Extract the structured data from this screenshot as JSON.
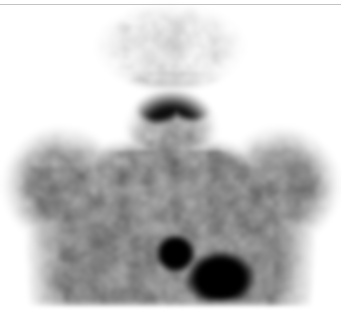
{
  "viewer": {
    "modality_label": "Nuclear medicine scintigraphy",
    "view_label": "Anterior whole-body (head / neck / thorax)",
    "width": 341,
    "height": 331,
    "background_color": "#ffffff",
    "border_rule_color": "#b8b8b8"
  },
  "colormap": {
    "name": "inverted-grayscale",
    "min_label": "low counts",
    "max_label": "high counts",
    "min_color": "#ffffff",
    "mid_color": "#9a9a9a",
    "max_color": "#000000"
  },
  "chart_data": {
    "type": "heatmap",
    "xlabel": "",
    "ylabel": "",
    "grid": false,
    "legend": "none",
    "xlim": [
      0,
      341
    ],
    "ylim": [
      0,
      331
    ],
    "intensity_scale": {
      "encoding": "inverted grayscale, darker = higher radiotracer uptake",
      "levels": [
        {
          "label": "background (no counts)",
          "gray": 255,
          "hex": "#ffffff"
        },
        {
          "label": "faint soft tissue",
          "gray": 225,
          "hex": "#e1e1e1"
        },
        {
          "label": "low soft tissue",
          "gray": 200,
          "hex": "#c8c8c8"
        },
        {
          "label": "moderate soft tissue",
          "gray": 154,
          "hex": "#9a9a9a"
        },
        {
          "label": "increased uptake",
          "gray": 100,
          "hex": "#646464"
        },
        {
          "label": "intense focal uptake",
          "gray": 40,
          "hex": "#282828"
        },
        {
          "label": "maximum focal uptake",
          "gray": 0,
          "hex": "#000000"
        }
      ]
    },
    "regions": [
      {
        "name": "head-cranium",
        "cx": 170,
        "cy": 46,
        "rx": 57,
        "ry": 34,
        "intensity": 0.16,
        "note": "faint mottled cranial background activity"
      },
      {
        "name": "neck",
        "cx": 171,
        "cy": 130,
        "rx": 36,
        "ry": 32,
        "intensity": 0.42,
        "note": "soft tissue neck"
      },
      {
        "name": "left-parotid-gland",
        "cx": 139,
        "cy": 90,
        "rx": 15,
        "ry": 13,
        "intensity": 1.0,
        "note": "intense focal uptake, left parotid"
      },
      {
        "name": "right-parotid-gland",
        "cx": 215,
        "cy": 90,
        "rx": 13,
        "ry": 12,
        "intensity": 1.0,
        "note": "intense focal uptake, right parotid"
      },
      {
        "name": "submandibular-left-lobe",
        "cx": 158,
        "cy": 101,
        "rx": 24,
        "ry": 20,
        "intensity": 1.0,
        "note": "left lobe of bilobed central hot structure"
      },
      {
        "name": "submandibular-right-lobe",
        "cx": 192,
        "cy": 100,
        "rx": 23,
        "ry": 19,
        "intensity": 1.0,
        "note": "right lobe of bilobed central hot structure"
      },
      {
        "name": "central-isthmus",
        "cx": 175,
        "cy": 95,
        "rx": 18,
        "ry": 13,
        "intensity": 1.0,
        "note": "isthmus bridging the two lobes"
      },
      {
        "name": "thorax-upper",
        "cx": 170,
        "cy": 200,
        "rx": 118,
        "ry": 56,
        "intensity": 0.45,
        "note": "diffuse mottled thoracic soft tissue"
      },
      {
        "name": "left-shoulder",
        "cx": 62,
        "cy": 185,
        "rx": 44,
        "ry": 44,
        "intensity": 0.42,
        "note": "left shoulder / proximal arm"
      },
      {
        "name": "right-shoulder",
        "cx": 280,
        "cy": 185,
        "rx": 44,
        "ry": 44,
        "intensity": 0.45,
        "note": "right shoulder / proximal arm"
      },
      {
        "name": "focal-hotspot-round",
        "cx": 175,
        "cy": 253,
        "rx": 17,
        "ry": 17,
        "intensity": 1.0,
        "note": "round intense focus, mid-lower mediastinum"
      },
      {
        "name": "focal-hotspot-dome",
        "cx": 220,
        "cy": 278,
        "rx": 30,
        "ry": 24,
        "intensity": 1.0,
        "note": "larger dome-shaped intense focus, left paramedian"
      },
      {
        "name": "inferior-low-count-band",
        "cx": 170,
        "cy": 313,
        "rx": 150,
        "ry": 20,
        "intensity": 0.08,
        "note": "inferior band of markedly reduced counts"
      }
    ],
    "hotspots_summary": {
      "count": 6,
      "labels": [
        "left parotid gland",
        "right parotid gland",
        "left submandibular lobe",
        "right submandibular lobe",
        "round mediastinal focus",
        "dome-shaped paramedian focus"
      ]
    }
  }
}
